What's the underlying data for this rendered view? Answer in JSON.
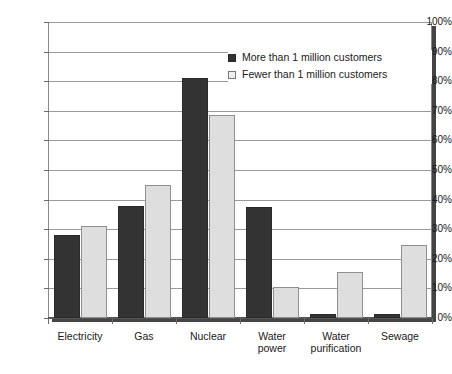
{
  "chart_data": {
    "type": "bar",
    "title": "",
    "subtitle": "",
    "xlabel": "",
    "ylabel": "",
    "ylim": [
      0,
      100
    ],
    "ytick_labels": [
      "0%",
      "10%",
      "20%",
      "30%",
      "40%",
      "50%",
      "60%",
      "70%",
      "80%",
      "90%",
      "100%"
    ],
    "ytick_values": [
      0,
      10,
      20,
      30,
      40,
      50,
      60,
      70,
      80,
      90,
      100
    ],
    "grid": true,
    "legend_position": "top-right",
    "categories": [
      "Electricity",
      "Gas",
      "Nuclear",
      "Water power",
      "Water purification",
      "Sewage"
    ],
    "category_lines": [
      [
        "Electricity"
      ],
      [
        "Gas"
      ],
      [
        "Nuclear"
      ],
      [
        "Water",
        "power"
      ],
      [
        "Water",
        "purification"
      ],
      [
        "Sewage"
      ]
    ],
    "series": [
      {
        "name": "More than 1 million customers",
        "color": "#333333",
        "values": [
          28,
          38,
          81,
          37.5,
          1.3,
          1.3
        ]
      },
      {
        "name": "Fewer than 1 million customers",
        "color": "#dedede",
        "values": [
          31,
          45,
          68.5,
          10.5,
          15.5,
          24.5
        ]
      }
    ]
  },
  "legend": {
    "items": [
      {
        "label": "More than 1 million customers",
        "swatch": "more"
      },
      {
        "label": "Fewer than 1 million customers",
        "swatch": "fewer"
      }
    ]
  },
  "colors": {
    "series_more": "#333333",
    "series_fewer": "#dedede",
    "gridline": "#9a9a9a",
    "axis": "#8a8a8a",
    "baseline": "#555555",
    "text": "#1a1a1a",
    "background": "#ffffff"
  }
}
